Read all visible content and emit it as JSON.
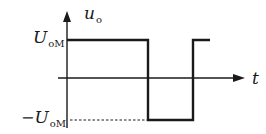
{
  "diagram": {
    "type": "square-wave-waveform",
    "y_axis_label": {
      "main": "u",
      "sub": "o"
    },
    "x_axis_label": {
      "main": "t"
    },
    "upper_level_label": {
      "prefix": "",
      "main": "U",
      "sub": "oM"
    },
    "lower_level_label": {
      "prefix": "−",
      "main": "U",
      "sub": "oM"
    },
    "colors": {
      "stroke": "#1a1a1a",
      "background": "#ffffff"
    },
    "waveform": {
      "segments": [
        {
          "level": "high",
          "from_x": 67,
          "to_x": 148
        },
        {
          "level": "low",
          "from_x": 148,
          "to_x": 193
        },
        {
          "level": "high",
          "from_x": 193,
          "to_x": 210
        }
      ],
      "high_y": 40,
      "low_y": 120,
      "zero_y": 78,
      "dashed_reference_to_low_level": true
    }
  }
}
